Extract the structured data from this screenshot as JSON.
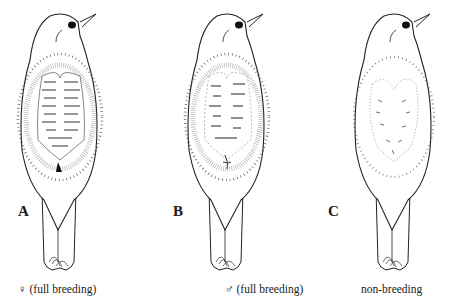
{
  "figure": {
    "panels": [
      {
        "letter": "A",
        "caption": "♀ (full breeding)",
        "state": "female full breeding brood patch"
      },
      {
        "letter": "B",
        "caption": "♂ (full breeding)",
        "state": "male full breeding brood patch"
      },
      {
        "letter": "C",
        "caption": "non-breeding",
        "state": "non-breeding"
      }
    ]
  }
}
